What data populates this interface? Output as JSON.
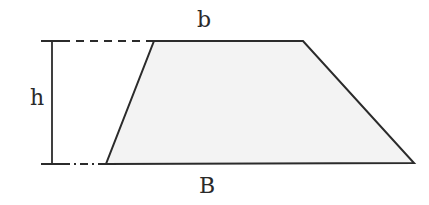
{
  "diagram": {
    "type": "trapezoid",
    "labels": {
      "top_base": "b",
      "bottom_base": "B",
      "height": "h"
    },
    "colors": {
      "stroke": "#2b2b2b",
      "fill": "#f3f3f3",
      "background": "#ffffff"
    },
    "vertices": {
      "top_left": [
        154,
        41
      ],
      "top_right": [
        303,
        41
      ],
      "bottom_right": [
        414,
        163
      ],
      "bottom_left": [
        106,
        164
      ]
    },
    "height_marker": {
      "x": 52,
      "y_top": 41,
      "y_bottom": 164
    }
  }
}
